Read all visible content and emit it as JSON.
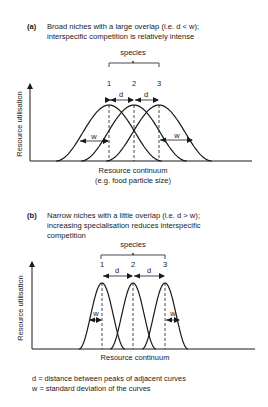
{
  "panel_a": {
    "tag": "(a)",
    "caption_line1": "Broad niches with a large overlap (i.e. d < w);",
    "caption_line2": "interspecific competition is relatively intense",
    "group_label": "species",
    "species_labels": [
      "1",
      "2",
      "3"
    ],
    "d_label": "d",
    "w_label": "w",
    "y_axis_label": "Resource utilisation",
    "x_axis_label_line1": "Resource continuum",
    "x_axis_label_line2": "(e.g. food particle size)",
    "niche_width": "broad"
  },
  "panel_b": {
    "tag": "(b)",
    "caption_line1": "Narrow niches with a little overlap (i.e. d > w);",
    "caption_line2": "increasing specialisation reduces interspecific",
    "caption_line3": "competition",
    "group_label": "species",
    "species_labels": [
      "1",
      "2",
      "3"
    ],
    "d_label": "d",
    "w_label": "w",
    "y_axis_label": "Resource utilisation",
    "x_axis_label_line1": "Resource continuum",
    "niche_width": "narrow"
  },
  "legend": {
    "line1": "d = distance between peaks of adjacent curves",
    "line2": "w = standard deviation of the curves"
  }
}
